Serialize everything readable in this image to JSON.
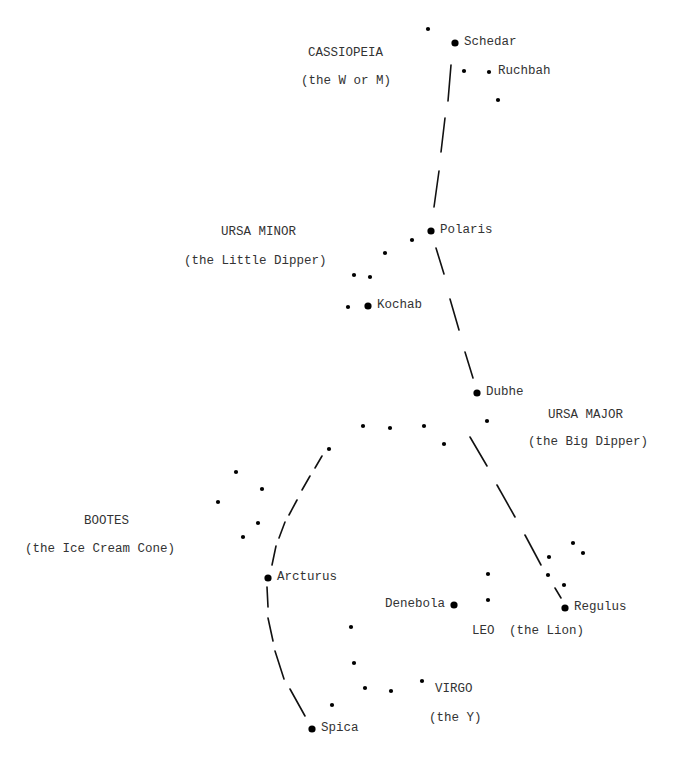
{
  "diagram": {
    "constellations": [
      {
        "name": "CASSIOPEIA",
        "nickname": "(the W or M)",
        "name_pos": [
          308,
          54
        ],
        "nick_pos": [
          301,
          82
        ]
      },
      {
        "name": "URSA MINOR",
        "nickname": "(the Little Dipper)",
        "name_pos": [
          221,
          233
        ],
        "nick_pos": [
          184,
          262
        ]
      },
      {
        "name": "URSA MAJOR",
        "nickname": "(the Big Dipper)",
        "name_pos": [
          548,
          416
        ],
        "nick_pos": [
          528,
          443
        ]
      },
      {
        "name": "BOOTES",
        "nickname": "(the Ice Cream Cone)",
        "name_pos": [
          84,
          522
        ],
        "nick_pos": [
          25,
          550
        ]
      },
      {
        "name": "LEO",
        "nickname": "(the Lion)",
        "name_pos": [
          472,
          632
        ],
        "nick_pos": [
          509,
          632
        ]
      },
      {
        "name": "VIRGO",
        "nickname": "(the Y)",
        "name_pos": [
          435,
          690
        ],
        "nick_pos": [
          429,
          719
        ]
      }
    ],
    "named_stars": [
      {
        "label": "Schedar",
        "x": 455,
        "y": 43
      },
      {
        "label": "Ruchbah",
        "x": 489,
        "y": 72
      },
      {
        "label": "Polaris",
        "x": 431,
        "y": 231
      },
      {
        "label": "Kochab",
        "x": 368,
        "y": 306
      },
      {
        "label": "Dubhe",
        "x": 477,
        "y": 393
      },
      {
        "label": "Arcturus",
        "x": 268,
        "y": 578
      },
      {
        "label": "Denebola",
        "x": 454,
        "y": 605,
        "label_left": true
      },
      {
        "label": "Regulus",
        "x": 565,
        "y": 608
      },
      {
        "label": "Spica",
        "x": 312,
        "y": 729
      }
    ],
    "big_stars": [
      [
        455,
        43
      ],
      [
        431,
        231
      ],
      [
        368,
        306
      ],
      [
        477,
        393
      ],
      [
        268,
        578
      ],
      [
        454,
        605
      ],
      [
        565,
        608
      ],
      [
        312,
        729
      ]
    ],
    "small_stars": [
      [
        428,
        29
      ],
      [
        464,
        71
      ],
      [
        489,
        72
      ],
      [
        498,
        100
      ],
      [
        412,
        240
      ],
      [
        385,
        253
      ],
      [
        354,
        275
      ],
      [
        370,
        277
      ],
      [
        348,
        307
      ],
      [
        487,
        421
      ],
      [
        329,
        449
      ],
      [
        363,
        426
      ],
      [
        390,
        428
      ],
      [
        424,
        426
      ],
      [
        444,
        444
      ],
      [
        236,
        472
      ],
      [
        218,
        502
      ],
      [
        262,
        489
      ],
      [
        258,
        523
      ],
      [
        243,
        537
      ],
      [
        573,
        543
      ],
      [
        583,
        553
      ],
      [
        549,
        557
      ],
      [
        548,
        575
      ],
      [
        564,
        585
      ],
      [
        488,
        574
      ],
      [
        488,
        600
      ],
      [
        351,
        627
      ],
      [
        354,
        663
      ],
      [
        365,
        688
      ],
      [
        391,
        691
      ],
      [
        422,
        681
      ],
      [
        332,
        705
      ]
    ],
    "pointer_line_dashes": [
      [
        451,
        65,
        448,
        101
      ],
      [
        445,
        118,
        441,
        152
      ],
      [
        439,
        171,
        434,
        207
      ],
      [
        436,
        248,
        444,
        274
      ],
      [
        450,
        299,
        459,
        330
      ],
      [
        465,
        352,
        473,
        378
      ],
      [
        470,
        437,
        487,
        466
      ],
      [
        497,
        485,
        515,
        517
      ],
      [
        525,
        535,
        541,
        565
      ],
      [
        555,
        588,
        561,
        598
      ]
    ],
    "arc_line_dashes": [
      [
        322,
        456,
        315,
        468
      ],
      [
        310,
        476,
        302,
        490
      ],
      [
        297,
        500,
        289,
        515
      ],
      [
        285,
        522,
        279,
        538
      ],
      [
        276,
        546,
        272,
        565
      ],
      [
        267,
        587,
        268,
        607
      ],
      [
        268,
        618,
        273,
        641
      ],
      [
        275,
        651,
        284,
        679
      ],
      [
        290,
        689,
        305,
        716
      ]
    ]
  }
}
